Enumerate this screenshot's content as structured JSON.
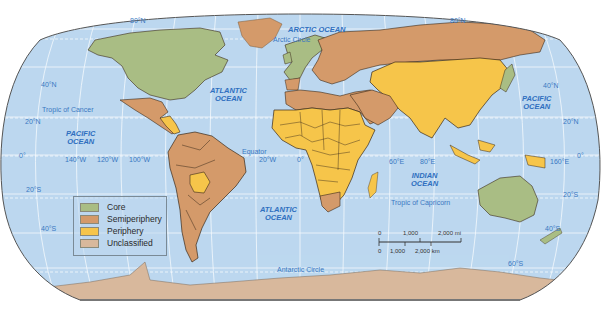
{
  "map": {
    "projection": "Robinson",
    "colors": {
      "ocean": "#bcd8ef",
      "core": "#a9bd84",
      "semiperiphery": "#d49a6a",
      "periphery": "#f6c54a",
      "unclassified": "#d8b89c",
      "border": "#3a2a1a",
      "frame": "#555555",
      "label": "#3a78c2"
    },
    "oceans": [
      {
        "id": "arctic",
        "name": "ARCTIC OCEAN"
      },
      {
        "id": "atlantic-north",
        "line1": "ATLANTIC",
        "line2": "OCEAN"
      },
      {
        "id": "atlantic-south",
        "line1": "ATLANTIC",
        "line2": "OCEAN"
      },
      {
        "id": "pacific-west",
        "line1": "PACIFIC",
        "line2": "OCEAN"
      },
      {
        "id": "pacific-east",
        "line1": "PACIFIC",
        "line2": "OCEAN"
      },
      {
        "id": "indian",
        "line1": "INDIAN",
        "line2": "OCEAN"
      }
    ],
    "lines": {
      "arctic_circle": "Arctic Circle",
      "tropic_cancer": "Tropic of Cancer",
      "equator": "Equator",
      "tropic_capricorn": "Tropic of Capricorn",
      "antarctic_circle": "Antarctic Circle"
    },
    "latitude_labels": {
      "n80_left": "80°N",
      "n80_right": "80°N",
      "n40_left": "40°N",
      "n40_right": "40°N",
      "n20_left": "20°N",
      "n20_right": "20°N",
      "eq_left": "0°",
      "eq_right": "0°",
      "s20_left": "20°S",
      "s20_right": "20°S",
      "s40_left": "40°S",
      "s40_right": "40°S",
      "s60_right": "60°S"
    },
    "longitude_labels": {
      "w140": "140°W",
      "w120": "120°W",
      "w100": "100°W",
      "w20": "20°W",
      "zero": "0°",
      "e60": "60°E",
      "e80": "80°E",
      "e160": "160°E"
    }
  },
  "legend": {
    "items": [
      {
        "label": "Core",
        "color": "#a9bd84"
      },
      {
        "label": "Semiperiphery",
        "color": "#d49a6a"
      },
      {
        "label": "Periphery",
        "color": "#f6c54a"
      },
      {
        "label": "Unclassified",
        "color": "#d8b89c"
      }
    ]
  },
  "scale_bar": {
    "mi": {
      "zero": "0",
      "mid": "1,000",
      "end": "2,000 mi"
    },
    "km": {
      "zero": "0",
      "mid": "1,000",
      "end": "2,000 km"
    }
  }
}
